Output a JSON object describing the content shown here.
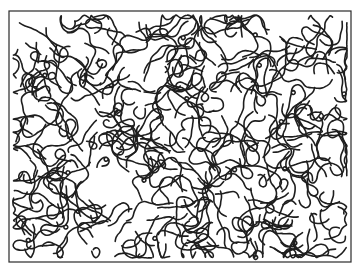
{
  "image": {
    "description": "Black-and-white maze-like squiggle line drawing inside a rectangular frame",
    "background_color": "#ffffff",
    "line_color": "#1e1e1e",
    "frame": {
      "x": 9,
      "y": 11,
      "width": 342,
      "height": 251
    },
    "pattern": {
      "seed": 7,
      "squiggle_count": 330,
      "min_len": 8,
      "max_len": 26,
      "step": 3.2,
      "loop_chance": 0.05
    }
  }
}
